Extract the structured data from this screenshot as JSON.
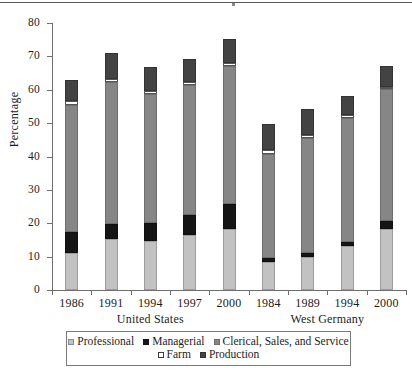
{
  "chart_data": {
    "type": "bar",
    "stacked": true,
    "title": "",
    "xlabel": "",
    "ylabel": "Percentage",
    "ylim": [
      0,
      80
    ],
    "yticks": [
      0,
      10,
      20,
      30,
      40,
      50,
      60,
      70,
      80
    ],
    "ytick_labels": [
      "0",
      "10",
      "20",
      "30",
      "40",
      "50",
      "60",
      "70",
      "80"
    ],
    "grid": false,
    "legend_position": "bottom",
    "categories": [
      "1986",
      "1991",
      "1994",
      "1997",
      "2000",
      "1984",
      "1989",
      "1994",
      "2000"
    ],
    "groups": [
      {
        "label": "United States",
        "categories": [
          "1986",
          "1991",
          "1994",
          "1997",
          "2000"
        ]
      },
      {
        "label": "West Germany",
        "categories": [
          "1984",
          "1989",
          "1994",
          "2000"
        ]
      }
    ],
    "series": [
      {
        "name": "Professional",
        "color": "#c2c2c2",
        "values": [
          11.0,
          15.2,
          14.7,
          16.4,
          18.3,
          8.5,
          10.0,
          13.3,
          18.2
        ]
      },
      {
        "name": "Managerial",
        "color": "#151515",
        "values": [
          6.3,
          4.6,
          5.5,
          6.0,
          7.5,
          1.2,
          1.1,
          1.2,
          2.6
        ]
      },
      {
        "name": "Clerical, Sales, and Service",
        "color": "#868686",
        "values": [
          38.2,
          42.4,
          38.4,
          39.0,
          41.2,
          30.9,
          34.4,
          37.1,
          39.4
        ]
      },
      {
        "name": "Farm",
        "color": "#ffffff",
        "values": [
          1.2,
          1.1,
          1.1,
          0.9,
          1.0,
          1.3,
          1.0,
          0.8,
          0.6
        ]
      },
      {
        "name": "Production",
        "color": "#434343",
        "values": [
          6.3,
          7.8,
          7.0,
          6.8,
          7.2,
          7.8,
          7.8,
          5.6,
          6.2
        ]
      }
    ],
    "totals": [
      63.0,
      71.1,
      66.7,
      69.1,
      75.2,
      49.7,
      54.3,
      58.0,
      67.0
    ]
  },
  "legend": {
    "items": [
      {
        "label": "Professional",
        "key": "professional"
      },
      {
        "label": "Managerial",
        "key": "managerial"
      },
      {
        "label": "Clerical, Sales, and Service",
        "key": "clerical"
      },
      {
        "label": "Farm",
        "key": "farm"
      },
      {
        "label": "Production",
        "key": "production"
      }
    ]
  }
}
